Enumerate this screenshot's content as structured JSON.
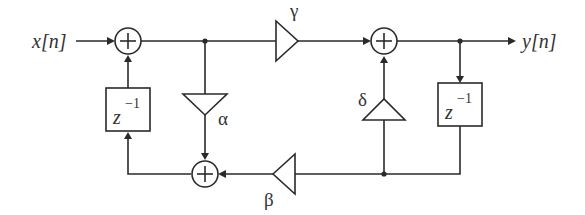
{
  "diagram": {
    "type": "signal-flow-block-diagram",
    "input_label": "x[n]",
    "output_label": "y[n]",
    "adders": [
      {
        "id": "adder-input",
        "symbol": "+"
      },
      {
        "id": "adder-output",
        "symbol": "+"
      },
      {
        "id": "adder-feedback",
        "symbol": "+"
      }
    ],
    "delays": [
      {
        "id": "delay-left",
        "base": "z",
        "exponent": "−1"
      },
      {
        "id": "delay-right",
        "base": "z",
        "exponent": "−1"
      }
    ],
    "gains": [
      {
        "id": "gain-gamma",
        "label": "γ"
      },
      {
        "id": "gain-alpha",
        "label": "α"
      },
      {
        "id": "gain-beta",
        "label": "β"
      },
      {
        "id": "gain-delta",
        "label": "δ"
      }
    ],
    "colors": {
      "line": "#2a2a2a",
      "text": "#333333",
      "background": "#ffffff"
    }
  }
}
